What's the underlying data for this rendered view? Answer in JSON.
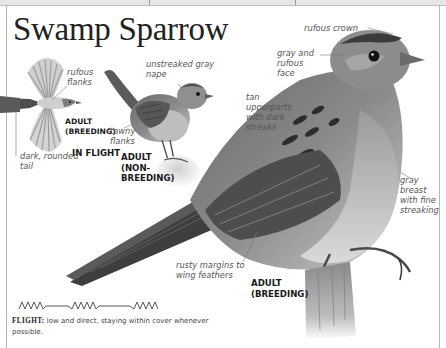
{
  "page": {
    "title": "Swamp Sparrow",
    "colors": {
      "border": "#b8b8b8",
      "title": "#222222",
      "label": "#555555",
      "caption": "#1a1a1a"
    }
  },
  "illustrations": {
    "in_flight": {
      "caption_age": "ADULT",
      "caption_plumage": "(BREEDING)",
      "caption_pose": "IN FLIGHT",
      "labels": {
        "flanks": "rufous flanks",
        "tail": "dark, rounded tail"
      }
    },
    "non_breeding": {
      "caption_age": "ADULT",
      "caption_plumage_1": "(NON-",
      "caption_plumage_2": "BREEDING)",
      "labels": {
        "nape": "unstreaked gray nape",
        "flanks": "tawny flanks"
      }
    },
    "breeding": {
      "caption_age": "ADULT",
      "caption_plumage": "(BREEDING)",
      "labels": {
        "crown": "rufous crown",
        "face": "gray and rufous face",
        "upperparts": "tan upperparts with dark streaks",
        "breast": "gray breast with fine streaking",
        "wing": "rusty margins to wing feathers"
      }
    }
  },
  "flight": {
    "pattern_icon": "zigzag-flight-pattern",
    "label": "FLIGHT:",
    "description": "low and direct, staying within cover whenever possible."
  }
}
